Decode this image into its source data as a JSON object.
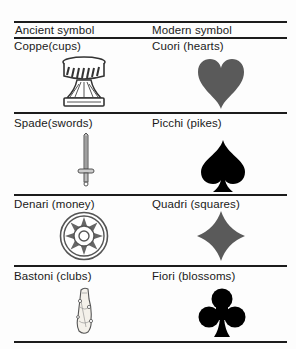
{
  "table": {
    "headers": {
      "ancient": "Ancient symbol",
      "modern": "Modern symbol"
    },
    "rows": [
      {
        "ancient": "Coppe(cups)",
        "ancient_icon": "cup-icon",
        "modern": "Cuori (hearts)",
        "modern_icon": "heart-icon",
        "modern_color": "#5a5a5a"
      },
      {
        "ancient": "Spade(swords)",
        "ancient_icon": "sword-icon",
        "modern": "Picchi (pikes)",
        "modern_icon": "spade-icon",
        "modern_color": "#000000"
      },
      {
        "ancient": "Denari (money)",
        "ancient_icon": "coin-icon",
        "modern": "Quadri (squares)",
        "modern_icon": "diamond-icon",
        "modern_color": "#5a5a5a"
      },
      {
        "ancient": "Bastoni (clubs)",
        "ancient_icon": "baton-icon",
        "modern": "Fiori (blossoms)",
        "modern_icon": "club-icon",
        "modern_color": "#000000"
      }
    ]
  }
}
